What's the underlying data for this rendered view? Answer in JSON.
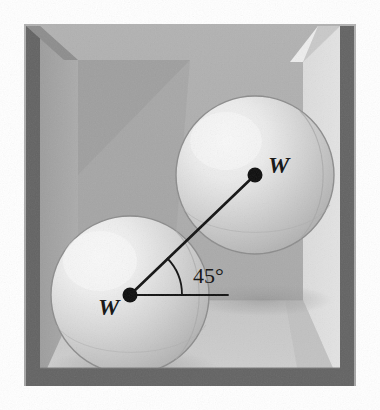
{
  "figure": {
    "type": "physics-free-body-diagram",
    "canvas": {
      "width": 380,
      "height": 410,
      "background": "#ffffff"
    }
  },
  "labels": {
    "upper_weight": "W",
    "lower_weight": "W",
    "angle": "45°"
  },
  "geometry": {
    "upper_sphere": {
      "cx": 255,
      "cy": 175,
      "r": 79
    },
    "lower_sphere": {
      "cx": 130,
      "cy": 295,
      "r": 79
    },
    "center_line": {
      "x1": 130,
      "y1": 295,
      "x2": 255,
      "y2": 175
    },
    "horizontal_ref": {
      "x1": 130,
      "y1": 295,
      "x2": 228,
      "y2": 295
    },
    "angle_value_degrees": 45,
    "dot_radius": 7
  },
  "colors": {
    "page_background": "#ffffff",
    "wall_edge_dark": "#606060",
    "wall_face_mid": "#a8a8a8",
    "wall_face_light": "#d9d9d9",
    "back_wall": "#adadad",
    "back_wall_shadow": "#9a9a9a",
    "floor_light": "#c9c9c9",
    "floor_shade": "#bdbdbd",
    "sphere_base": "#c6c6c6",
    "sphere_highlight": "#f2f2f2",
    "sphere_outline": "#8f8f8f",
    "ink": "#111111"
  }
}
